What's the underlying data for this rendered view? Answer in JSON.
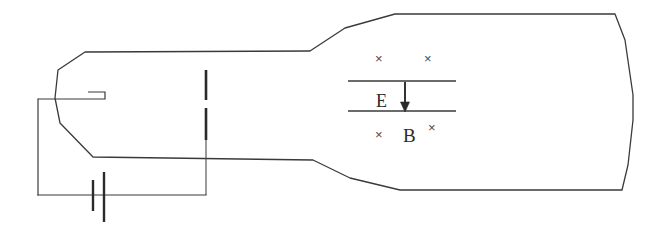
{
  "figure": {
    "name": "cathode-ray-tube-with-crossed-fields",
    "background_color": "#ffffff",
    "line_color": "#3a3a3a",
    "text_color": "#2b2b2b",
    "width": 666,
    "height": 235
  },
  "labels": {
    "electric_field": "E",
    "magnetic_field": "B",
    "field_into_page_symbol": "×"
  },
  "crosses": {
    "above_plates": [
      {
        "id": "cross-above-1",
        "x": 375,
        "y": 52
      },
      {
        "id": "cross-above-2",
        "x": 424,
        "y": 52
      }
    ],
    "below_plates": [
      {
        "id": "cross-below-1",
        "x": 375,
        "y": 128
      },
      {
        "id": "cross-below-2",
        "x": 428,
        "y": 121
      }
    ]
  },
  "geometry": {
    "tube_outline": "M 85,52 L 310,51 L 345,28 L 395,14 L 615,14 L 625,40 L 633,95 L 633,120 L 628,165 L 622,190 L 400,190 L 350,178 L 313,160 L 93,157 L 60,123 L 55,98 L 58,70 Z",
    "top_plate": {
      "x1": 348,
      "y1": 81,
      "x2": 456,
      "y2": 81
    },
    "bottom_plate": {
      "x1": 348,
      "y1": 111,
      "x2": 456,
      "y2": 111
    },
    "field_arrow": {
      "x": 405,
      "y1": 82,
      "y2": 111
    },
    "deflector_upper": {
      "x": 206,
      "y1": 70,
      "y2": 100
    },
    "deflector_lower": {
      "x": 206,
      "y1": 108,
      "y2": 140
    },
    "deflector_lead": {
      "x": 206,
      "y1": 140,
      "y2": 195
    },
    "cathode_lead": "M 38,99 L 105,99 L 105,92 L 88,92",
    "circuit_left_wire": {
      "x": 38,
      "y1": 99,
      "y2": 195
    },
    "circuit_bottom_wire": {
      "x1": 38,
      "y1": 195,
      "x2": 206,
      "y2": 195
    },
    "battery_short_plate": {
      "x": 93,
      "y1": 180,
      "y2": 211
    },
    "battery_long_plate": {
      "x": 104,
      "y1": 172,
      "y2": 222
    }
  }
}
